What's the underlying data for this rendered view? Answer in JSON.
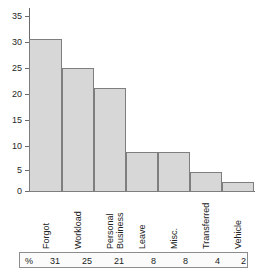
{
  "chart_data": {
    "type": "bar",
    "title": "",
    "subtitle": "",
    "xlabel": "",
    "ylabel": "",
    "categories": [
      "Forgot",
      "Workload",
      "Personal Business",
      "Leave",
      "Misc.",
      "Transferred",
      "Vehicle"
    ],
    "values": [
      31,
      25,
      21,
      8,
      8,
      4,
      2
    ],
    "ylim": [
      0,
      35
    ],
    "yticks": [
      0,
      5,
      10,
      15,
      20,
      25,
      30,
      35
    ],
    "ytick_labels": [
      "0",
      "5",
      "10",
      "15",
      "20",
      "25",
      "30",
      "35"
    ],
    "grid": false,
    "legend": null,
    "bar_fill_color": "#d7d7d7",
    "bar_edge_color": "#7e7e7e",
    "axis_color": "#6b6b6b"
  },
  "category_labels": [
    {
      "lines": [
        "Forgot"
      ]
    },
    {
      "lines": [
        "Workload"
      ]
    },
    {
      "lines": [
        "Personal",
        "Business"
      ]
    },
    {
      "lines": [
        "Leave"
      ]
    },
    {
      "lines": [
        "Misc."
      ]
    },
    {
      "lines": [
        "Transferred"
      ]
    },
    {
      "lines": [
        "Vehicle"
      ]
    }
  ],
  "value_table": {
    "unit_symbol": "%",
    "values": [
      "31",
      "25",
      "21",
      "8",
      "8",
      "4",
      "2"
    ]
  }
}
